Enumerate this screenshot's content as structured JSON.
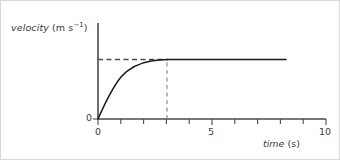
{
  "figure": {
    "background_color": "#ffffff",
    "border_color": "#d8d8d8"
  },
  "chart_data": {
    "type": "line",
    "title": "",
    "subtitle": "",
    "xlabel_html": "<span class=\"it\">time</span> (s)",
    "xlabel_text": "time (s)",
    "ylabel_html": "<span class=\"it\">velocity</span> (m s<span class=\"sup\">−1</span>)",
    "ylabel_text": "velocity (m s−1)",
    "xlim": [
      0,
      10
    ],
    "ylim": [
      0,
      1.0
    ],
    "grid": false,
    "legend": null,
    "legend_position": "none",
    "x_major_ticks": [
      0,
      5,
      10
    ],
    "x_major_tick_labels": [
      "0",
      "5",
      "10"
    ],
    "x_minor_ticks": [
      1,
      2,
      3,
      4,
      6,
      7,
      8,
      9
    ],
    "y_ticks": [
      0
    ],
    "y_tick_labels": [
      "0"
    ],
    "line_color": "#1a1a1a",
    "axis_color": "#4a4a4a",
    "guide_color": "#6a6a6a",
    "series": [
      {
        "name": "velocity",
        "style": "solid",
        "description": "exponential rise to terminal velocity then constant",
        "x": [
          0.0,
          0.2,
          0.4,
          0.6,
          0.8,
          1.0,
          1.2,
          1.4,
          1.6,
          1.8,
          2.0,
          2.2,
          2.4,
          2.6,
          2.8,
          3.0,
          3.4,
          4.0,
          5.0,
          6.0,
          7.0,
          8.0,
          8.25
        ],
        "y": [
          0.0,
          0.129,
          0.242,
          0.341,
          0.427,
          0.503,
          0.569,
          0.626,
          0.676,
          0.719,
          0.757,
          0.791,
          0.82,
          0.845,
          0.868,
          0.887,
          0.918,
          0.951,
          0.982,
          0.993,
          0.998,
          1.0,
          1.0
        ]
      }
    ],
    "annotations": [
      {
        "kind": "horizontal-dashed-guide",
        "label": "terminal velocity level",
        "y": 1.0,
        "x_from": 0,
        "x_to": 3.0
      },
      {
        "kind": "vertical-dashed-guide",
        "label": "time curve reaches terminal velocity",
        "x": 3.0,
        "y_from": 0,
        "y_to": 1.0
      }
    ]
  }
}
